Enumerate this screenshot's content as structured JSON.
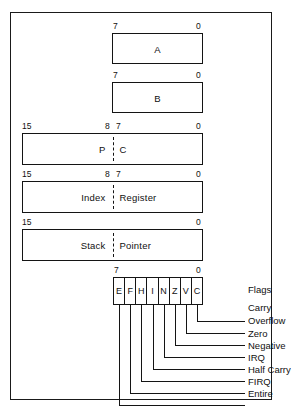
{
  "diagram": {
    "registers": [
      {
        "id": "accumulator-a",
        "name": "A",
        "label": "A",
        "width_bits": 8,
        "bit_labels": [
          "7",
          "0"
        ],
        "split": false
      },
      {
        "id": "accumulator-b",
        "name": "B",
        "label": "B",
        "width_bits": 8,
        "bit_labels": [
          "7",
          "0"
        ],
        "split": false
      },
      {
        "id": "program-counter",
        "name": "PC",
        "label_left": "P",
        "label_right": "C",
        "width_bits": 16,
        "bit_labels": [
          "15",
          "8",
          "7",
          "0"
        ],
        "split": true
      },
      {
        "id": "index-register",
        "name": "Index Register",
        "label_left": "Index",
        "label_right": "Register",
        "width_bits": 16,
        "bit_labels": [
          "15",
          "8",
          "7",
          "0"
        ],
        "split": true
      },
      {
        "id": "stack-pointer",
        "name": "Stack Pointer",
        "label_left": "Stack",
        "label_right": "Pointer",
        "width_bits": 16,
        "bit_labels": [
          "15",
          "0"
        ],
        "split": true
      }
    ],
    "flags_register": {
      "id": "condition-code-register",
      "bit_labels": [
        "7",
        "0"
      ],
      "bits": [
        {
          "symbol": "E",
          "bit": 7,
          "callout": "Entire"
        },
        {
          "symbol": "F",
          "bit": 6,
          "callout": "FIRQ"
        },
        {
          "symbol": "H",
          "bit": 5,
          "callout": "Half Carry"
        },
        {
          "symbol": "I",
          "bit": 4,
          "callout": "IRQ"
        },
        {
          "symbol": "N",
          "bit": 3,
          "callout": "Negative"
        },
        {
          "symbol": "Z",
          "bit": 2,
          "callout": "Zero"
        },
        {
          "symbol": "V",
          "bit": 1,
          "callout": "Overflow"
        },
        {
          "symbol": "C",
          "bit": 0,
          "callout": "Carry"
        }
      ],
      "header_callout": "Flags",
      "callout_order": [
        "Flags",
        "Carry",
        "Overflow",
        "Zero",
        "Negative",
        "IRQ",
        "Half Carry",
        "FIRQ",
        "Entire"
      ]
    },
    "colors": {
      "ink": "#141414",
      "paper": "#ffffff"
    }
  }
}
